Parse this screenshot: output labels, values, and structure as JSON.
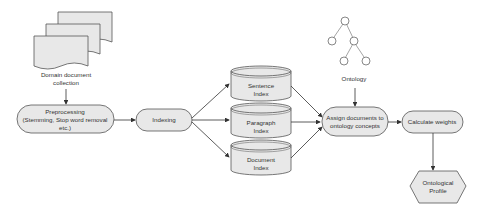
{
  "diagram": {
    "type": "flowchart",
    "nodes": {
      "domain_docs": {
        "label_lines": [
          "Domain document",
          "collection"
        ],
        "shape": "document-stack"
      },
      "preprocessing": {
        "label_lines": [
          "Preprocessing",
          "(Stemming, Stop word removal",
          "etc.)"
        ],
        "shape": "rounded"
      },
      "indexing": {
        "label_lines": [
          "Indexing"
        ],
        "shape": "rounded"
      },
      "sentence_index": {
        "label_lines": [
          "Sentence",
          "Index"
        ],
        "shape": "cylinder"
      },
      "paragraph_index": {
        "label_lines": [
          "Paragraph",
          "Index"
        ],
        "shape": "cylinder"
      },
      "document_index": {
        "label_lines": [
          "Document",
          "Index"
        ],
        "shape": "cylinder"
      },
      "ontology": {
        "label_lines": [
          "Ontology"
        ],
        "shape": "tree"
      },
      "assign": {
        "label_lines": [
          "Assign documents to",
          "ontology concepts"
        ],
        "shape": "rounded"
      },
      "calc_weights": {
        "label_lines": [
          "Calculate weights"
        ],
        "shape": "rounded"
      },
      "profile": {
        "label_lines": [
          "Ontological",
          "Profile"
        ],
        "shape": "hexagon"
      }
    },
    "edges": [
      [
        "domain_docs",
        "preprocessing"
      ],
      [
        "preprocessing",
        "indexing"
      ],
      [
        "indexing",
        "sentence_index"
      ],
      [
        "indexing",
        "paragraph_index"
      ],
      [
        "indexing",
        "document_index"
      ],
      [
        "sentence_index",
        "assign"
      ],
      [
        "paragraph_index",
        "assign"
      ],
      [
        "document_index",
        "assign"
      ],
      [
        "ontology",
        "assign"
      ],
      [
        "assign",
        "calc_weights"
      ],
      [
        "calc_weights",
        "profile"
      ]
    ],
    "colors": {
      "fill": "#e8e8e8",
      "stroke": "#555555",
      "text": "#333333"
    }
  }
}
